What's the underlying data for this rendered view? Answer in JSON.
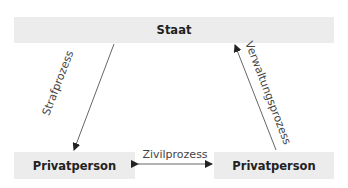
{
  "nodes": {
    "staat": "Staat",
    "privatperson_left": "Privatperson",
    "privatperson_right": "Privatperson"
  },
  "edges": {
    "strafprozess": "Strafprozess",
    "verwaltungsprozess": "Verwaltungsprozess",
    "zivilprozess": "Zivilprozess"
  },
  "colors": {
    "box_fill": "#ececec",
    "line": "#444444"
  }
}
